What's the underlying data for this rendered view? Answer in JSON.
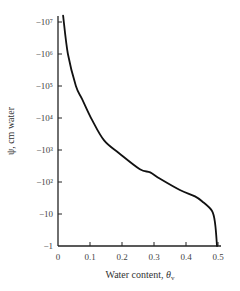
{
  "chart_data": {
    "type": "line",
    "title": "",
    "xlabel": "Water content, θv",
    "ylabel": "ψ, cm water",
    "xlim": [
      0,
      0.5
    ],
    "ylim_log10": [
      0,
      7
    ],
    "y_scale": "log (negative values)",
    "grid": false,
    "legend": null,
    "x_ticks": [
      "0",
      "0.1",
      "0.2",
      "0.3",
      "0.4",
      "0.5"
    ],
    "y_ticks": [
      "−1",
      "−10",
      "−10²",
      "−10³",
      "−10⁴",
      "−10⁵",
      "−10⁶",
      "−10⁷"
    ],
    "series": [
      {
        "name": "soil water retention curve",
        "x": [
          0.016,
          0.031,
          0.056,
          0.075,
          0.106,
          0.144,
          0.191,
          0.256,
          0.288,
          0.319,
          0.381,
          0.428,
          0.45,
          0.481,
          0.491,
          0.497
        ],
        "psi_log10": [
          7.2,
          6.0,
          5.0,
          4.6,
          3.95,
          3.3,
          2.9,
          2.4,
          2.3,
          2.1,
          1.75,
          1.55,
          1.4,
          1.1,
          0.7,
          0.0
        ]
      }
    ]
  },
  "labels": {
    "xlabel_main": "Water content, ",
    "xlabel_theta": "θ",
    "xlabel_sub": "v",
    "ylabel": "ψ, cm water"
  }
}
